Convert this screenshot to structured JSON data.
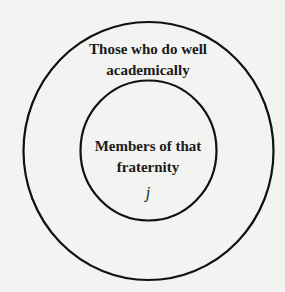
{
  "diagram": {
    "type": "nested-sets (Venn)",
    "outer_set": {
      "label_line1": "Those who do well",
      "label_line2": "academically"
    },
    "inner_set": {
      "label_line1": "Members of that",
      "label_line2": "fraternity",
      "element": "j"
    },
    "colors": {
      "background": "#f3f3f1",
      "stroke": "#111111",
      "text": "#1a1a1a"
    }
  }
}
